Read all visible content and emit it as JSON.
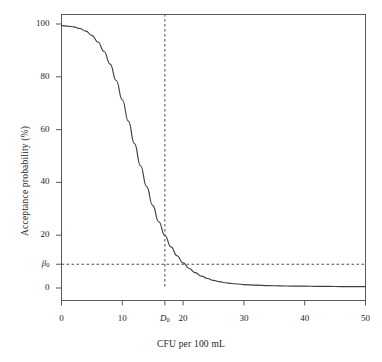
{
  "chart_data": {
    "type": "line",
    "title": "",
    "xlabel": "CFU per 100 mL",
    "ylabel": "Acceptance probability (%)",
    "xlim": [
      0,
      50
    ],
    "ylim": [
      0,
      100
    ],
    "grid": false,
    "legend": null,
    "x_ticks": [
      {
        "value": 0,
        "label": "0"
      },
      {
        "value": 10,
        "label": "10"
      },
      {
        "value": 17,
        "label": "D₀",
        "italic": true
      },
      {
        "value": 20,
        "label": "20"
      },
      {
        "value": 30,
        "label": "30"
      },
      {
        "value": 40,
        "label": "40"
      },
      {
        "value": 50,
        "label": "50"
      }
    ],
    "y_ticks": [
      {
        "value": 0,
        "label": "0"
      },
      {
        "value": 9,
        "label": "β₀",
        "italic": true
      },
      {
        "value": 20,
        "label": "20"
      },
      {
        "value": 40,
        "label": "40"
      },
      {
        "value": 60,
        "label": "60"
      },
      {
        "value": 80,
        "label": "80"
      },
      {
        "value": 100,
        "label": "100"
      }
    ],
    "series": [
      {
        "name": "acceptance-probability",
        "color": "#3f3f3f",
        "x": [
          0,
          1,
          2,
          3,
          4,
          5,
          6,
          7,
          8,
          9,
          10,
          11,
          12,
          13,
          14,
          15,
          16,
          17,
          18,
          19,
          20,
          21,
          22,
          23,
          24,
          25,
          26,
          27,
          28,
          29,
          30,
          32,
          34,
          36,
          38,
          40,
          42,
          44,
          46,
          48,
          50
        ],
        "y": [
          99.4,
          99.2,
          98.9,
          98.3,
          97.3,
          95.7,
          93.2,
          89.6,
          84.8,
          78.6,
          71.3,
          63.2,
          54.7,
          46.3,
          38.4,
          31.3,
          25.1,
          19.9,
          15.6,
          12.2,
          9.5,
          7.4,
          5.8,
          4.5,
          3.6,
          2.9,
          2.4,
          2.0,
          1.7,
          1.5,
          1.3,
          1.1,
          0.9,
          0.8,
          0.7,
          0.7,
          0.6,
          0.6,
          0.5,
          0.5,
          0.5
        ]
      }
    ],
    "reference_lines": [
      {
        "name": "d0-vertical",
        "orientation": "vertical",
        "value": 17,
        "style": "dashed",
        "color": "#4d4d4d"
      },
      {
        "name": "beta0-horizontal",
        "orientation": "horizontal",
        "value": 9,
        "style": "dashed",
        "color": "#4d4d4d"
      }
    ],
    "annotations": [
      {
        "name": "design-point",
        "x": 17,
        "y": 9,
        "label": ""
      }
    ]
  }
}
